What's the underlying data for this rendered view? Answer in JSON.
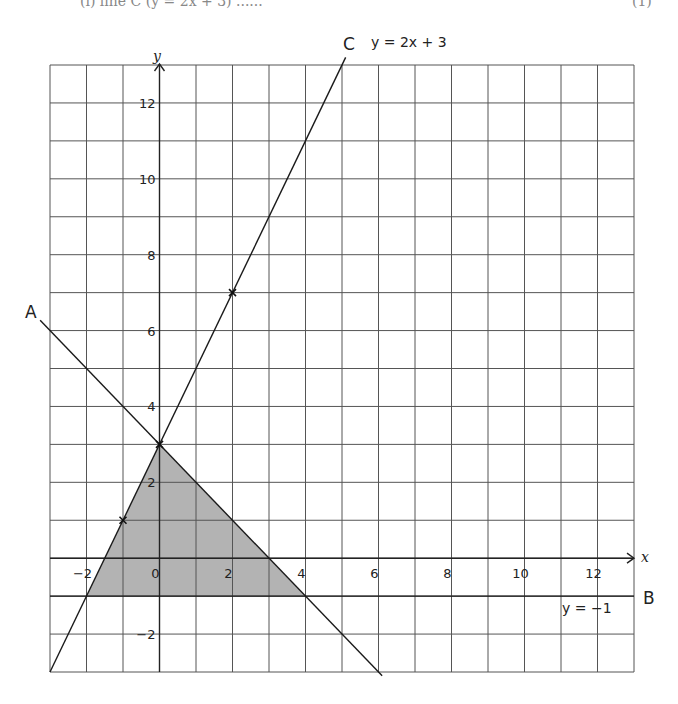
{
  "header": {
    "cut_off_question_text": "(i)  line C (y = 2x + 3) ......",
    "cut_off_marks": "(1)"
  },
  "chart_data": {
    "type": "line",
    "title": "",
    "xlabel": "x",
    "ylabel": "y",
    "xlim": [
      -3,
      13
    ],
    "ylim": [
      -3,
      13
    ],
    "grid": true,
    "x_tick_labels": [
      "−2",
      "0",
      "2",
      "4",
      "6",
      "8",
      "10",
      "12"
    ],
    "x_ticks": [
      -2,
      0,
      2,
      4,
      6,
      8,
      10,
      12
    ],
    "y_tick_labels": [
      "−2",
      "2",
      "4",
      "6",
      "8",
      "10",
      "12"
    ],
    "y_ticks": [
      -2,
      2,
      4,
      6,
      8,
      10,
      12
    ],
    "series": [
      {
        "name": "A",
        "equation": "y = 3 − x",
        "label": "A",
        "x": [
          -3.27,
          6.1
        ],
        "y": [
          6.27,
          -3.1
        ]
      },
      {
        "name": "B",
        "equation": "y = −1",
        "label": "B",
        "equation_label": "y = −1",
        "x": [
          -3,
          13
        ],
        "y": [
          -1,
          -1
        ]
      },
      {
        "name": "C",
        "equation": "y = 2x + 3",
        "label": "C",
        "equation_label": "y = 2x + 3",
        "x": [
          -3,
          5.1
        ],
        "y": [
          -3,
          13.2
        ]
      }
    ],
    "marked_points": [
      {
        "x": -1,
        "y": 1
      },
      {
        "x": 0,
        "y": 3
      },
      {
        "x": 2,
        "y": 7
      }
    ],
    "shaded_region": {
      "description": "Region bounded by lines A, B and C",
      "vertices": [
        [
          0,
          3
        ],
        [
          4,
          -1
        ],
        [
          -2,
          -1
        ]
      ],
      "color": "#b3b3b3"
    }
  },
  "labels": {
    "x_axis": "x",
    "y_axis": "y",
    "line_a": "A",
    "line_b": "B",
    "line_c": "C",
    "eq_c": "y = 2x + 3",
    "eq_b": "y = −1",
    "origin": "0"
  }
}
